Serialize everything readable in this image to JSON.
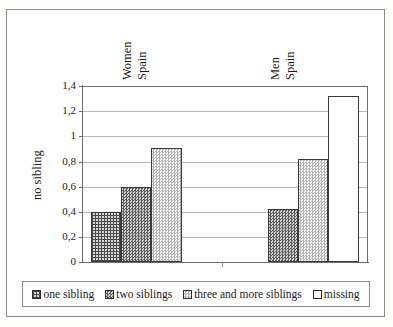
{
  "chart_data": {
    "type": "bar",
    "title": "",
    "subtitle": "",
    "xlabel": "",
    "ylabel": "no sibling",
    "ylim": [
      0,
      1.4
    ],
    "ytick_labels": [
      "0",
      "0,2",
      "0,4",
      "0,6",
      "0,8",
      "1",
      "1,2",
      "1,4"
    ],
    "ytick_values": [
      0,
      0.2,
      0.4,
      0.6,
      0.8,
      1.0,
      1.2,
      1.4
    ],
    "grid": "horizontal",
    "legend_position": "bottom",
    "decimal_separator": ",",
    "categories": [
      "Women Spain",
      "Men Spain"
    ],
    "category_labels": [
      {
        "line1": "Women",
        "line2": "Spain"
      },
      {
        "line1": "Men",
        "line2": "Spain"
      }
    ],
    "series": [
      {
        "name": "one sibling",
        "pattern": "cross-hatch",
        "values": [
          0.4,
          null
        ]
      },
      {
        "name": "two siblings",
        "pattern": "checkerboard",
        "values": [
          0.6,
          0.42
        ]
      },
      {
        "name": "three and more siblings",
        "pattern": "light-dots",
        "values": [
          0.91,
          0.82
        ]
      },
      {
        "name": "missing",
        "pattern": "solid-white",
        "values": [
          null,
          1.32
        ]
      }
    ],
    "bars": [
      {
        "group": "Women Spain",
        "series": "one sibling",
        "value": 0.4
      },
      {
        "group": "Women Spain",
        "series": "two siblings",
        "value": 0.6
      },
      {
        "group": "Women Spain",
        "series": "three and more siblings",
        "value": 0.91
      },
      {
        "group": "Men Spain",
        "series": "two siblings",
        "value": 0.42
      },
      {
        "group": "Men Spain",
        "series": "three and more siblings",
        "value": 0.82
      },
      {
        "group": "Men Spain",
        "series": "missing",
        "value": 1.32
      }
    ]
  },
  "axis": {
    "y_title": "no sibling",
    "ticks": [
      "1,4",
      "1,2",
      "1",
      "0,8",
      "0,6",
      "0,4",
      "0,2",
      "0"
    ]
  },
  "groups": [
    {
      "id": "women-spain",
      "line1": "Women",
      "line2": "Spain"
    },
    {
      "id": "men-spain",
      "line1": "Men",
      "line2": "Spain"
    }
  ],
  "legend": {
    "items": [
      {
        "label": "one sibling",
        "pattern": "cross-hatch"
      },
      {
        "label": "two siblings",
        "pattern": "checkerboard"
      },
      {
        "label": "three and more siblings",
        "pattern": "light-dots"
      },
      {
        "label": "missing",
        "pattern": "solid-white"
      }
    ]
  },
  "colors": {
    "frame": "#8c8c8c",
    "axis": "#6d6d6d",
    "gridline": "#b9b9b9",
    "bar_outline": "#3a3a3a",
    "pattern_dark": "#4a4a4a",
    "pattern_mid": "#5d5d5d",
    "pattern_light": "#b4b4b4",
    "background": "#ffffff",
    "text": "#1b1b1b"
  }
}
